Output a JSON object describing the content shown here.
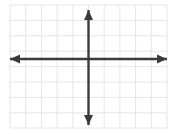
{
  "figure": {
    "kind": "blank-cartesian-coordinate-plane",
    "background_color": "#ffffff",
    "width": 175,
    "height": 134
  },
  "grid": {
    "visible": true,
    "color": "#e6e6e6",
    "line_width": 1,
    "cell_size": 15.7,
    "left": 10,
    "top": 5,
    "right": 167,
    "bottom": 128,
    "columns": 10,
    "rows": 8,
    "x_lines": [
      10,
      25.7,
      41.4,
      57.1,
      72.8,
      88.5,
      104.2,
      119.9,
      135.6,
      151.3,
      167
    ],
    "y_lines": [
      5,
      20.4,
      35.8,
      51.2,
      66.6,
      82,
      97.4,
      112.8,
      128
    ]
  },
  "axes": {
    "color": "#3b3b3b",
    "line_width": 2.4,
    "origin_x": 88.5,
    "origin_y": 59,
    "x_axis": {
      "name": "x-axis",
      "from_x": 10,
      "to_x": 167,
      "y": 59,
      "arrow_left": true,
      "arrow_right": true
    },
    "y_axis": {
      "name": "y-axis",
      "x": 88.5,
      "from_y": 10,
      "to_y": 125,
      "arrow_up": true,
      "arrow_down": true
    },
    "arrow_head": {
      "width": 9,
      "length": 10
    }
  },
  "labels": {
    "tick_labels": [],
    "axis_titles": [],
    "title": ""
  },
  "chart_data": {
    "type": "scatter",
    "title": "",
    "xlabel": "",
    "ylabel": "",
    "xlim": [
      -5,
      5
    ],
    "ylim": [
      -4.5,
      3.5
    ],
    "grid": true,
    "legend": "none",
    "x": [],
    "y": [],
    "series": [],
    "annotations": []
  }
}
